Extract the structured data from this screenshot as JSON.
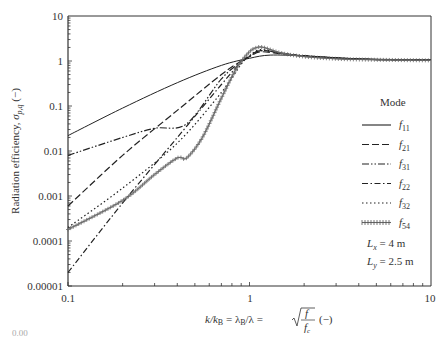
{
  "chart_data": {
    "type": "line",
    "title": "",
    "xlabel": "k/k_B = λ_B/λ = √(f/f_c) (−)",
    "ylabel": "Radiation efficiency, σ_p,q (−)",
    "xscale": "log",
    "yscale": "log",
    "xlim": [
      0.1,
      10
    ],
    "ylim": [
      1e-05,
      10
    ],
    "x_ticks": [
      "0.1",
      "1",
      "10"
    ],
    "y_ticks": [
      "10",
      "1",
      "0.1",
      "0.01",
      "0.001",
      "0.0001",
      "0.00001"
    ],
    "grid": false,
    "legend_title": "Mode",
    "legend_position": "right",
    "annotations": [
      "L_x = 4 m",
      "L_y = 2.5 m"
    ],
    "series": [
      {
        "name": "f11",
        "style": "solid",
        "x": [
          0.1,
          0.2,
          0.4,
          0.7,
          1.0,
          1.3,
          2.0,
          4.0,
          10.0
        ],
        "y": [
          0.022,
          0.09,
          0.33,
          0.8,
          1.15,
          1.35,
          1.3,
          1.12,
          1.05
        ]
      },
      {
        "name": "f21",
        "style": "dashed",
        "x": [
          0.1,
          0.2,
          0.4,
          0.7,
          0.9,
          1.0,
          1.15,
          1.5,
          2.0,
          4.0,
          10.0
        ],
        "y": [
          0.0006,
          0.008,
          0.08,
          0.5,
          1.0,
          1.25,
          1.6,
          1.45,
          1.3,
          1.1,
          1.04
        ]
      },
      {
        "name": "f31",
        "style": "dash-dot-dot",
        "x": [
          0.1,
          0.2,
          0.3,
          0.45,
          0.7,
          0.9,
          1.0,
          1.15,
          1.5,
          2.0,
          4.0,
          10.0
        ],
        "y": [
          0.008,
          0.02,
          0.032,
          0.04,
          0.4,
          0.95,
          1.25,
          1.7,
          1.5,
          1.3,
          1.1,
          1.04
        ]
      },
      {
        "name": "f22",
        "style": "dash-dot",
        "x": [
          0.1,
          0.2,
          0.4,
          0.7,
          0.9,
          1.0,
          1.15,
          1.5,
          2.0,
          4.0,
          10.0
        ],
        "y": [
          2e-05,
          0.0007,
          0.02,
          0.3,
          0.95,
          1.3,
          1.7,
          1.5,
          1.3,
          1.1,
          1.04
        ]
      },
      {
        "name": "f32",
        "style": "dotted",
        "x": [
          0.1,
          0.2,
          0.4,
          0.7,
          0.9,
          1.0,
          1.15,
          1.5,
          2.0,
          4.0,
          10.0
        ],
        "y": [
          0.0002,
          0.0015,
          0.015,
          0.2,
          0.85,
          1.3,
          1.8,
          1.5,
          1.3,
          1.1,
          1.04
        ]
      },
      {
        "name": "f54",
        "style": "plus-markers",
        "x": [
          0.1,
          0.2,
          0.3,
          0.4,
          0.45,
          0.55,
          0.7,
          0.85,
          1.0,
          1.1,
          1.2,
          1.5,
          2.0,
          3.0,
          4.0,
          10.0
        ],
        "y": [
          0.00018,
          0.0008,
          0.003,
          0.007,
          0.007,
          0.02,
          0.15,
          0.7,
          1.6,
          2.0,
          2.0,
          1.5,
          1.25,
          1.12,
          1.08,
          1.03
        ]
      }
    ]
  },
  "labels": {
    "y_ticks": [
      "10",
      "1",
      "0.1",
      "0.01",
      "0.001",
      "0.0001",
      "0.00001"
    ],
    "x_ticks": [
      "0.1",
      "1",
      "10"
    ],
    "ylabel_main": "Radiation efficiency, ",
    "ylabel_sigma": "σ",
    "ylabel_sub": "p,q",
    "ylabel_unit": " (−)",
    "xlabel_k": "k/k",
    "xlabel_kB_sub": "B",
    "xlabel_eq1": " = λ",
    "xlabel_lamB_sub": "B",
    "xlabel_eq2": "/λ = ",
    "xlabel_f": "f",
    "xlabel_fc": "f",
    "xlabel_fc_sub": "c",
    "xlabel_unit": "(−)",
    "legend_title": "Mode",
    "legend_items": [
      {
        "f": "f",
        "sub": "11"
      },
      {
        "f": "f",
        "sub": "21"
      },
      {
        "f": "f",
        "sub": "31"
      },
      {
        "f": "f",
        "sub": "22"
      },
      {
        "f": "f",
        "sub": "32"
      },
      {
        "f": "f",
        "sub": "54"
      }
    ],
    "dim_x_L": "L",
    "dim_x_sub": "x",
    "dim_x_val": " = 4 m",
    "dim_y_L": "L",
    "dim_y_sub": "y",
    "dim_y_val": " = 2.5 m",
    "stray_text": "0.00"
  }
}
